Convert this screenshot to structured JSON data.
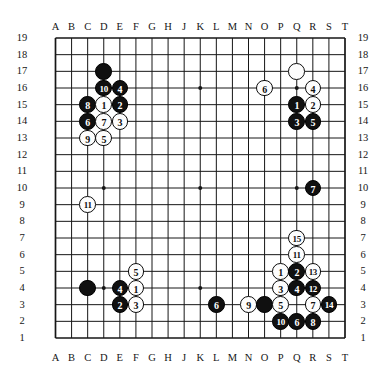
{
  "diagram": {
    "type": "go-board",
    "board_size": 19,
    "column_labels": [
      "A",
      "B",
      "C",
      "D",
      "E",
      "F",
      "G",
      "H",
      "J",
      "K",
      "L",
      "M",
      "N",
      "O",
      "P",
      "Q",
      "R",
      "S",
      "T"
    ],
    "row_labels": [
      "19",
      "18",
      "17",
      "16",
      "15",
      "14",
      "13",
      "12",
      "11",
      "10",
      "9",
      "8",
      "7",
      "6",
      "5",
      "4",
      "3",
      "2",
      "1"
    ],
    "star_points": [
      {
        "col": "D",
        "row": 16
      },
      {
        "col": "K",
        "row": 16
      },
      {
        "col": "Q",
        "row": 16
      },
      {
        "col": "D",
        "row": 10
      },
      {
        "col": "K",
        "row": 10
      },
      {
        "col": "Q",
        "row": 10
      },
      {
        "col": "D",
        "row": 4
      },
      {
        "col": "K",
        "row": 4
      },
      {
        "col": "Q",
        "row": 4
      }
    ],
    "colors": {
      "black_stone": "#101010",
      "white_stone": "#fdfdfd",
      "stone_outline": "#0d0d0d",
      "grid_line": "#161616",
      "board_background": "#ffffff",
      "label_text": "#151515"
    },
    "stones": [
      {
        "col": "D",
        "row": 17,
        "color": "black",
        "label": ""
      },
      {
        "col": "D",
        "row": 16,
        "color": "black",
        "label": "10"
      },
      {
        "col": "E",
        "row": 16,
        "color": "black",
        "label": "4"
      },
      {
        "col": "C",
        "row": 15,
        "color": "black",
        "label": "8"
      },
      {
        "col": "D",
        "row": 15,
        "color": "white",
        "label": "1"
      },
      {
        "col": "E",
        "row": 15,
        "color": "black",
        "label": "2"
      },
      {
        "col": "C",
        "row": 14,
        "color": "black",
        "label": "6"
      },
      {
        "col": "D",
        "row": 14,
        "color": "white",
        "label": "7"
      },
      {
        "col": "E",
        "row": 14,
        "color": "white",
        "label": "3"
      },
      {
        "col": "C",
        "row": 13,
        "color": "white",
        "label": "9"
      },
      {
        "col": "D",
        "row": 13,
        "color": "white",
        "label": "5"
      },
      {
        "col": "Q",
        "row": 17,
        "color": "white",
        "label": ""
      },
      {
        "col": "O",
        "row": 16,
        "color": "white",
        "label": "6"
      },
      {
        "col": "R",
        "row": 16,
        "color": "white",
        "label": "4"
      },
      {
        "col": "Q",
        "row": 15,
        "color": "black",
        "label": "1"
      },
      {
        "col": "R",
        "row": 15,
        "color": "white",
        "label": "2"
      },
      {
        "col": "Q",
        "row": 14,
        "color": "black",
        "label": "3"
      },
      {
        "col": "R",
        "row": 14,
        "color": "black",
        "label": "5"
      },
      {
        "col": "R",
        "row": 10,
        "color": "black",
        "label": "7"
      },
      {
        "col": "C",
        "row": 9,
        "color": "white",
        "label": "11"
      },
      {
        "col": "Q",
        "row": 7,
        "color": "white",
        "label": "15"
      },
      {
        "col": "Q",
        "row": 6,
        "color": "white",
        "label": "11"
      },
      {
        "col": "P",
        "row": 5,
        "color": "white",
        "label": "1"
      },
      {
        "col": "Q",
        "row": 5,
        "color": "black",
        "label": "2"
      },
      {
        "col": "R",
        "row": 5,
        "color": "white",
        "label": "13"
      },
      {
        "col": "P",
        "row": 4,
        "color": "white",
        "label": "3"
      },
      {
        "col": "Q",
        "row": 4,
        "color": "black",
        "label": "4"
      },
      {
        "col": "R",
        "row": 4,
        "color": "black",
        "label": "12"
      },
      {
        "col": "N",
        "row": 3,
        "color": "white",
        "label": "9"
      },
      {
        "col": "O",
        "row": 3,
        "color": "black",
        "label": ""
      },
      {
        "col": "P",
        "row": 3,
        "color": "white",
        "label": "5"
      },
      {
        "col": "R",
        "row": 3,
        "color": "white",
        "label": "7"
      },
      {
        "col": "S",
        "row": 3,
        "color": "black",
        "label": "14"
      },
      {
        "col": "P",
        "row": 2,
        "color": "black",
        "label": "10"
      },
      {
        "col": "Q",
        "row": 2,
        "color": "black",
        "label": "6"
      },
      {
        "col": "R",
        "row": 2,
        "color": "black",
        "label": "8"
      },
      {
        "col": "F",
        "row": 5,
        "color": "white",
        "label": "5"
      },
      {
        "col": "C",
        "row": 4,
        "color": "black",
        "label": ""
      },
      {
        "col": "E",
        "row": 4,
        "color": "black",
        "label": "4"
      },
      {
        "col": "F",
        "row": 4,
        "color": "white",
        "label": "1"
      },
      {
        "col": "E",
        "row": 3,
        "color": "black",
        "label": "2"
      },
      {
        "col": "F",
        "row": 3,
        "color": "white",
        "label": "3"
      },
      {
        "col": "L",
        "row": 3,
        "color": "black",
        "label": "6"
      }
    ]
  }
}
